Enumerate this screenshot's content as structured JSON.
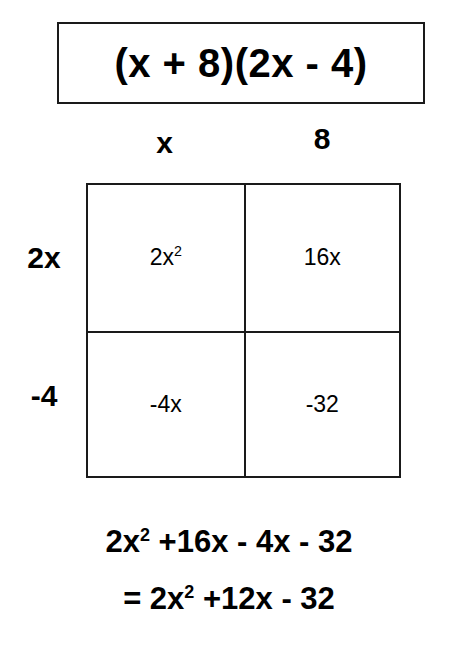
{
  "title": {
    "expression": "(x + 8)(2x - 4)"
  },
  "grid": {
    "column_headers": [
      "x",
      "8"
    ],
    "row_headers": [
      "2x",
      "-4"
    ],
    "cells": [
      [
        {
          "base": "2x",
          "exponent": "2"
        },
        {
          "base": "16x",
          "exponent": ""
        }
      ],
      [
        {
          "base": "-4x",
          "exponent": ""
        },
        {
          "base": "-32",
          "exponent": ""
        }
      ]
    ]
  },
  "results": [
    {
      "prefix": "2x",
      "exponent": "2",
      "suffix": " +16x - 4x - 32"
    },
    {
      "prefix": "= 2x",
      "exponent": "2",
      "suffix": " +12x - 32"
    }
  ],
  "colors": {
    "ink": "#1a1a1a",
    "background": "#ffffff"
  }
}
